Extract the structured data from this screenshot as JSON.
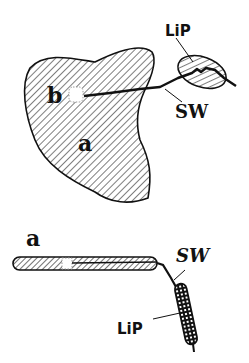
{
  "diagram": {
    "top_view": {
      "labels": {
        "a": "a",
        "b": "b",
        "lip": "LiP",
        "sw": "SW"
      }
    },
    "side_view": {
      "labels": {
        "a": "a",
        "sw": "SW",
        "lip": "LiP"
      }
    },
    "colors": {
      "ink": "#111111",
      "background": "#ffffff"
    }
  }
}
